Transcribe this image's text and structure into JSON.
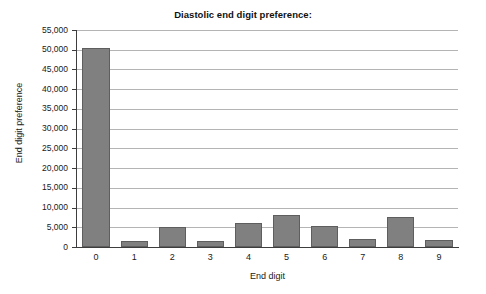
{
  "chart_data": {
    "type": "bar",
    "title": "Diastolic end digit preference:",
    "xlabel": "End digit",
    "ylabel": "End digit preference",
    "categories": [
      "0",
      "1",
      "2",
      "3",
      "4",
      "5",
      "6",
      "7",
      "8",
      "9"
    ],
    "values": [
      50500,
      1400,
      5100,
      1600,
      6100,
      8200,
      5300,
      2000,
      7600,
      1800
    ],
    "ylim": [
      0,
      55000
    ],
    "ytick_values": [
      0,
      5000,
      10000,
      15000,
      20000,
      25000,
      30000,
      35000,
      40000,
      45000,
      50000,
      55000
    ],
    "ytick_labels": [
      "0",
      "5,000",
      "10,000",
      "15,000",
      "20,000",
      "25,000",
      "30,000",
      "35,000",
      "40,000",
      "45,000",
      "50,000",
      "55,000"
    ],
    "grid": true,
    "legend": false,
    "legend_position": "none",
    "bar_color": "#808080",
    "bar_edge_color": "#5e5e5e",
    "grid_color": "#b4b4b4",
    "axis_color": "#3d3d3d",
    "background_color": "#ffffff"
  }
}
